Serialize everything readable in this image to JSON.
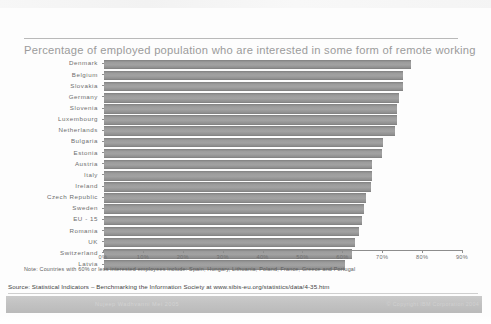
{
  "slide": {
    "title": "Percentage of employed population who are interested in some form of remote working",
    "note": "Note: Countries with 60% or less interested employees include: Spain, Hungary, Lithuania, Poland, France, Greece and Portugal",
    "source": "Source: Statistical Indicators – Benchmarking the Information Society at www.sibis-eu.org/statistics/data/4-35.htm",
    "footer_left": "Nujeep Wadhvanni  Mei  2005",
    "footer_right": "© Copyright IBM Corporation 2004",
    "accent_bar_color": "#9d9d9d",
    "title_color": "#9b9b9b",
    "footer_bar_color": "#bdbdbd"
  },
  "chart_data": {
    "type": "bar",
    "orientation": "horizontal",
    "title": "Percentage of employed population who are interested in some form of remote working",
    "xlabel": "",
    "ylabel": "",
    "xlim": [
      0,
      90
    ],
    "xticks": [
      0,
      10,
      20,
      30,
      40,
      50,
      60,
      70,
      80,
      90
    ],
    "xtick_labels": [
      "0%",
      "10%",
      "20%",
      "30%",
      "40%",
      "50%",
      "60%",
      "70%",
      "80%",
      "90%"
    ],
    "grid": false,
    "legend": false,
    "categories": [
      "Denmark",
      "Belgium",
      "Slovakia",
      "Germany",
      "Slovenia",
      "Luxembourg",
      "Netherlands",
      "Bulgaria",
      "Estonia",
      "Austria",
      "Italy",
      "Ireland",
      "Czech Republic",
      "Sweden",
      "EU - 15",
      "Romania",
      "UK",
      "Switzerland",
      "Latvia"
    ],
    "values": [
      77.0,
      75.0,
      75.0,
      74.0,
      73.5,
      73.5,
      73.0,
      70.0,
      69.8,
      67.3,
      67.1,
      67.0,
      65.6,
      65.3,
      64.8,
      64.0,
      62.8,
      62.2,
      60.3
    ],
    "unit": "%"
  }
}
